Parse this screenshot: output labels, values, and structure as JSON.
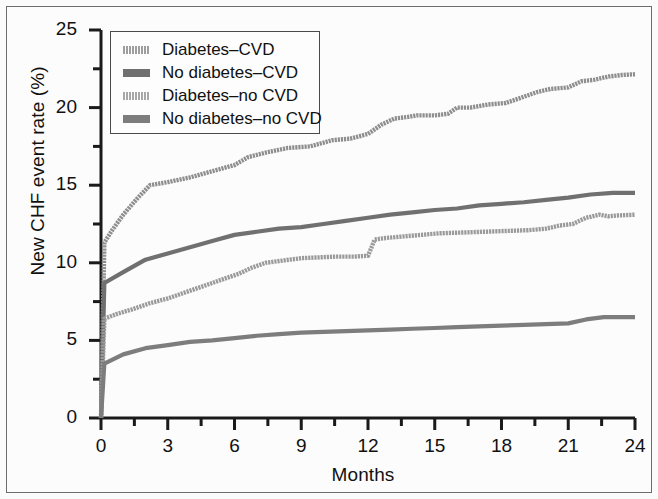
{
  "chart_data": {
    "type": "line",
    "title": "",
    "xlabel": "Months",
    "ylabel": "New CHF event rate (%)",
    "xlim": [
      0,
      24
    ],
    "ylim": [
      0,
      25
    ],
    "xticks": [
      0,
      3,
      6,
      9,
      12,
      15,
      18,
      21,
      24
    ],
    "xtick_labels": [
      "0",
      "3",
      "6",
      "9",
      "12",
      "15",
      "18",
      "21",
      "24"
    ],
    "xminor_ticks": [
      1.5,
      4.5,
      7.5,
      10.5,
      13.5,
      16.5,
      19.5,
      22.5
    ],
    "yticks": [
      0,
      5,
      10,
      15,
      20,
      25
    ],
    "ytick_labels": [
      "0",
      "5",
      "10",
      "15",
      "20",
      "25"
    ],
    "yminor_ticks": [
      2.5,
      7.5,
      12.5,
      17.5,
      22.5
    ],
    "grid": false,
    "legend_position": "upper left",
    "series": [
      {
        "name": "Diabetes-CVD",
        "color": "#8e8e8e",
        "style": "dithered",
        "x": [
          0,
          0.15,
          0.5,
          1.0,
          1.6,
          2.2,
          3.0,
          4.0,
          5.0,
          6.0,
          6.6,
          7.4,
          8.4,
          9.4,
          10.4,
          11.2,
          12.0,
          12.6,
          13.2,
          13.8,
          14.2,
          15.0,
          15.6,
          16.0,
          16.6,
          17.4,
          18.2,
          19.0,
          19.6,
          20.2,
          21.0,
          21.6,
          22.2,
          22.8,
          23.4,
          24.0
        ],
        "y": [
          0,
          11.3,
          12.1,
          13.1,
          14.1,
          15.0,
          15.2,
          15.5,
          15.9,
          16.3,
          16.8,
          17.1,
          17.4,
          17.5,
          17.9,
          18.0,
          18.3,
          18.9,
          19.3,
          19.4,
          19.5,
          19.5,
          19.6,
          20.0,
          20.0,
          20.2,
          20.3,
          20.7,
          21.0,
          21.2,
          21.3,
          21.7,
          21.8,
          22.0,
          22.1,
          22.15
        ]
      },
      {
        "name": "No diabetes-CVD",
        "color": "#707070",
        "style": "solid",
        "x": [
          0,
          0.15,
          1.0,
          2.0,
          3.0,
          4.0,
          5.0,
          6.0,
          7.0,
          8.0,
          9.0,
          10.0,
          11.0,
          12.0,
          13.0,
          14.0,
          15.0,
          16.0,
          17.0,
          18.0,
          19.0,
          20.0,
          21.0,
          22.0,
          23.0,
          24.0
        ],
        "y": [
          0,
          8.7,
          9.4,
          10.2,
          10.6,
          11.0,
          11.4,
          11.8,
          12.0,
          12.2,
          12.3,
          12.5,
          12.7,
          12.9,
          13.1,
          13.25,
          13.4,
          13.5,
          13.7,
          13.8,
          13.9,
          14.05,
          14.2,
          14.4,
          14.5,
          14.5
        ]
      },
      {
        "name": "Diabetes-no CVD",
        "color": "#9a9a9a",
        "style": "dithered",
        "x": [
          0,
          0.15,
          0.7,
          1.4,
          2.2,
          3.0,
          3.8,
          4.6,
          5.4,
          6.2,
          6.8,
          7.4,
          8.2,
          9.0,
          9.8,
          10.6,
          11.4,
          12.0,
          12.3,
          12.8,
          13.6,
          14.4,
          15.2,
          16.2,
          17.2,
          18.2,
          19.2,
          20.0,
          20.6,
          21.2,
          21.8,
          22.4,
          22.8,
          23.2,
          24.0
        ],
        "y": [
          0,
          6.4,
          6.7,
          7.0,
          7.4,
          7.7,
          8.1,
          8.5,
          8.9,
          9.3,
          9.7,
          10.0,
          10.15,
          10.3,
          10.35,
          10.4,
          10.4,
          10.45,
          11.5,
          11.6,
          11.7,
          11.8,
          11.9,
          11.95,
          12.0,
          12.05,
          12.1,
          12.2,
          12.4,
          12.5,
          12.9,
          13.1,
          13.0,
          13.05,
          13.1
        ]
      },
      {
        "name": "No diabetes-no CVD",
        "color": "#7d7d7d",
        "style": "solid",
        "x": [
          0,
          0.15,
          1.0,
          2.0,
          3.0,
          4.0,
          5.0,
          6.0,
          7.0,
          8.0,
          9.0,
          10.0,
          11.0,
          12.0,
          13.0,
          14.0,
          15.0,
          16.0,
          17.0,
          18.0,
          19.0,
          20.0,
          21.0,
          21.8,
          22.6,
          23.2,
          24.0
        ],
        "y": [
          0,
          3.5,
          4.1,
          4.5,
          4.7,
          4.9,
          5.0,
          5.15,
          5.3,
          5.4,
          5.5,
          5.55,
          5.6,
          5.65,
          5.7,
          5.75,
          5.8,
          5.85,
          5.9,
          5.95,
          6.0,
          6.05,
          6.1,
          6.35,
          6.5,
          6.5,
          6.5
        ]
      }
    ]
  },
  "legend": {
    "items": [
      {
        "label": "Diabetes–CVD",
        "swatch": "#8e8e8e",
        "style": "dithered"
      },
      {
        "label": "No diabetes–CVD",
        "swatch": "#707070",
        "style": "solid"
      },
      {
        "label": "Diabetes–no CVD",
        "swatch": "#9a9a9a",
        "style": "dithered"
      },
      {
        "label": "No diabetes–no CVD",
        "swatch": "#7d7d7d",
        "style": "solid"
      }
    ]
  },
  "axes": {
    "y_title": "New CHF event rate (%)",
    "x_title": "Months"
  }
}
